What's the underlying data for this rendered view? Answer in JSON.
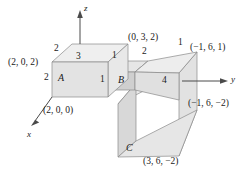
{
  "figure": {
    "background_color": "#ffffff",
    "stroke_color": "#8a8a8a",
    "text_color": "#1a1a1a"
  },
  "axes": [
    {
      "id": "z",
      "label": "z",
      "direction": "up"
    },
    {
      "id": "y",
      "label": "y",
      "direction": "right"
    },
    {
      "id": "x",
      "label": "x",
      "direction": "down-left"
    }
  ],
  "solids": [
    {
      "id": "A",
      "label": "A",
      "face_color": "#e3e3e3",
      "top_color": "#efefef",
      "side_color": "#e8e8e8"
    },
    {
      "id": "B",
      "label": "B",
      "face_color": "#cfcfcf",
      "top_color": "#e6e6e6",
      "side_color": "#dcdcdc"
    },
    {
      "id": "C",
      "label": "C",
      "face_color": "#d8d8d8",
      "top_color": "#ececec",
      "side_color": "#e2e2e2"
    }
  ],
  "coordinate_labels": [
    {
      "id": "p-2-0-2",
      "text": "(2, 0, 2)"
    },
    {
      "id": "p-2-0-0",
      "text": "(2, 0, 0)"
    },
    {
      "id": "p-0-3-2",
      "text": "(0, 3, 2)"
    },
    {
      "id": "p-n1-6-1",
      "text": "(−1, 6, 1)"
    },
    {
      "id": "p-n1-6-n2",
      "text": "(−1, 6, −2)"
    },
    {
      "id": "p-3-6-n2",
      "text": "(3, 6, −2)"
    }
  ],
  "dimension_labels": [
    {
      "id": "dim-a-top-left",
      "text": "2"
    },
    {
      "id": "dim-a-top-front",
      "text": "3"
    },
    {
      "id": "dim-a-height",
      "text": "2"
    },
    {
      "id": "dim-b-top-edge",
      "text": "1"
    },
    {
      "id": "dim-b-height",
      "text": "1"
    },
    {
      "id": "dim-b-depth",
      "text": "2"
    },
    {
      "id": "dim-c-top",
      "text": "1"
    },
    {
      "id": "dim-c-height",
      "text": "4"
    }
  ]
}
